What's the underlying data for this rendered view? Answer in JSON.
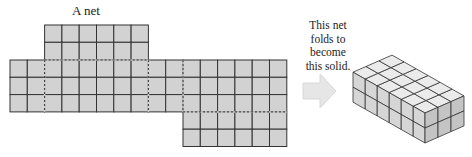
{
  "figure": {
    "net_label": "A net",
    "caption_lines": [
      "This net",
      "folds to",
      "become",
      "this solid."
    ],
    "arrow": "right-arrow",
    "colors": {
      "cell_fill": "#d2d2d2",
      "line": "#333333",
      "arrow_fill": "#e6e6e6",
      "solid_top": "#ebebeb",
      "solid_front": "#d6d6d6",
      "solid_side": "#c4c4c4"
    },
    "net": {
      "cell_size": 17.3,
      "top_flap": {
        "cols": 6,
        "rows": 2,
        "start_col": 2
      },
      "main_strip": {
        "cols": 16,
        "rows": 3
      },
      "bottom_flap": {
        "cols": 6,
        "rows": 2,
        "start_col": 10
      },
      "fold_lines_x_cols": [
        2,
        8,
        10
      ]
    },
    "solid": {
      "length": 6,
      "depth": 3,
      "height": 2
    }
  }
}
